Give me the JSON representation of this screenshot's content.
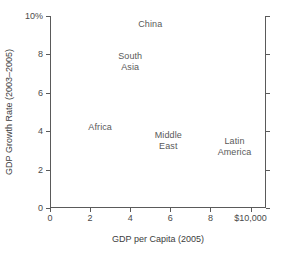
{
  "chart_data": {
    "type": "scatter",
    "title": "",
    "xlabel": "GDP per Capita (2005)",
    "ylabel": "GDP Growth Rate (2003–2005)",
    "xlim": [
      0,
      10.769
    ],
    "ylim": [
      0,
      10
    ],
    "xticks": [
      0,
      2,
      4,
      6,
      8,
      10
    ],
    "xtick_labels": [
      "0",
      "2",
      "4",
      "6",
      "8",
      "$10,000"
    ],
    "yticks": [
      0,
      2,
      4,
      6,
      8,
      10
    ],
    "ytick_labels": [
      "0",
      "2",
      "4",
      "6",
      "8",
      "10%"
    ],
    "grid": false,
    "legend": "none",
    "marker_style": "text-label-only",
    "points": [
      {
        "name": "China",
        "label": "China",
        "x": 5.0,
        "y": 9.6
      },
      {
        "name": "South Asia",
        "label": "South\nAsia",
        "x": 4.0,
        "y": 7.6
      },
      {
        "name": "Africa",
        "label": "Africa",
        "x": 2.5,
        "y": 4.2
      },
      {
        "name": "Middle East",
        "label": "Middle\nEast",
        "x": 5.9,
        "y": 3.5
      },
      {
        "name": "Latin America",
        "label": "Latin\nAmerica",
        "x": 9.2,
        "y": 3.2
      }
    ]
  },
  "colors": {
    "axis": "#5a5a5a",
    "tick_text": "#4a4a4a",
    "axis_title": "#3c3c3c",
    "data_label": "#595959",
    "background": "#ffffff"
  }
}
